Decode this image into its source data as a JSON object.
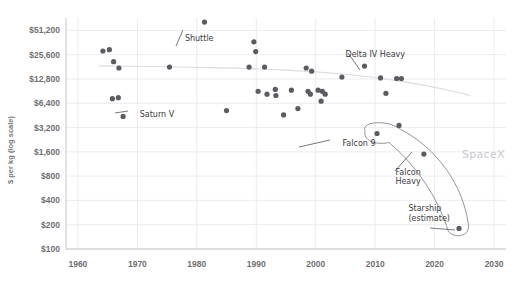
{
  "chart_data": {
    "type": "scatter",
    "title": "",
    "xlabel": "",
    "ylabel": "$ per kg (log scale)",
    "xlim": [
      1958,
      2032
    ],
    "ylim": [
      100,
      73000
    ],
    "yscale": "log",
    "grid": true,
    "legend": null,
    "x_ticks": [
      1960,
      1970,
      1980,
      1990,
      2000,
      2010,
      2020,
      2030
    ],
    "x_tick_labels": [
      "1960",
      "1970",
      "1980",
      "1990",
      "2000",
      "2010",
      "2020",
      "2030"
    ],
    "y_ticks": [
      100,
      200,
      400,
      800,
      1600,
      3200,
      6400,
      12800,
      25600,
      51200
    ],
    "y_tick_labels": [
      "$100",
      "$200",
      "$400",
      "$800",
      "$1,600",
      "$3,200",
      "$6,400",
      "$12,800",
      "$25,600",
      "$51,200"
    ],
    "series": [
      {
        "name": "Launch vehicles",
        "color": "#5b5b62",
        "points": [
          {
            "x": 1964.2,
            "y": 28500
          },
          {
            "x": 1965.3,
            "y": 29500
          },
          {
            "x": 1966.0,
            "y": 21000
          },
          {
            "x": 1966.9,
            "y": 17500
          },
          {
            "x": 1965.8,
            "y": 7300
          },
          {
            "x": 1966.8,
            "y": 7500
          },
          {
            "x": 1967.6,
            "y": 4400,
            "label": "Saturn V"
          },
          {
            "x": 1975.4,
            "y": 18000
          },
          {
            "x": 1981.3,
            "y": 65000,
            "label": "Shuttle"
          },
          {
            "x": 1985.0,
            "y": 5200
          },
          {
            "x": 1989.6,
            "y": 37000
          },
          {
            "x": 1989.9,
            "y": 28000
          },
          {
            "x": 1988.8,
            "y": 18000
          },
          {
            "x": 1991.4,
            "y": 18000
          },
          {
            "x": 1990.3,
            "y": 9000
          },
          {
            "x": 1991.8,
            "y": 8300
          },
          {
            "x": 1993.2,
            "y": 9500
          },
          {
            "x": 1993.3,
            "y": 8000
          },
          {
            "x": 1994.6,
            "y": 4600
          },
          {
            "x": 1995.9,
            "y": 9300
          },
          {
            "x": 1997.0,
            "y": 5500
          },
          {
            "x": 1998.4,
            "y": 17500
          },
          {
            "x": 1999.3,
            "y": 16000
          },
          {
            "x": 1998.7,
            "y": 9000
          },
          {
            "x": 1999.1,
            "y": 8300
          },
          {
            "x": 2000.4,
            "y": 9300
          },
          {
            "x": 2001.1,
            "y": 9000
          },
          {
            "x": 2001.6,
            "y": 8300
          },
          {
            "x": 2000.9,
            "y": 6800
          },
          {
            "x": 2004.4,
            "y": 13500,
            "label": "Delta IV Heavy"
          },
          {
            "x": 2008.2,
            "y": 18500
          },
          {
            "x": 2010.9,
            "y": 13200
          },
          {
            "x": 2013.6,
            "y": 13000
          },
          {
            "x": 2014.4,
            "y": 13000
          },
          {
            "x": 2011.8,
            "y": 8500
          },
          {
            "x": 2014.0,
            "y": 3400
          },
          {
            "x": 2010.3,
            "y": 2700,
            "label": "Falcon 9"
          },
          {
            "x": 2018.2,
            "y": 1500,
            "label": "Falcon Heavy"
          },
          {
            "x": 2024.1,
            "y": 180,
            "label": "Starship (estimate)"
          }
        ]
      }
    ],
    "trend_line": {
      "name": "cost trend",
      "color": "#dcdce1",
      "points": [
        {
          "x": 1963.5,
          "y": 18600
        },
        {
          "x": 1975.0,
          "y": 18300
        },
        {
          "x": 1990.0,
          "y": 17200
        },
        {
          "x": 2000.0,
          "y": 15800
        },
        {
          "x": 2010.0,
          "y": 13600
        },
        {
          "x": 2020.0,
          "y": 10200
        },
        {
          "x": 2026.0,
          "y": 8000
        }
      ]
    },
    "annotations": [
      {
        "text": "Shuttle",
        "x": 1978.0,
        "y": 38000,
        "style": "handwritten"
      },
      {
        "text": "Saturn V",
        "x": 1970.4,
        "y": 4300,
        "style": "handwritten"
      },
      {
        "text": "Delta IV Heavy",
        "x": 2005.0,
        "y": 24000,
        "style": "handwritten"
      },
      {
        "text": "Falcon 9",
        "x": 2004.5,
        "y": 1900,
        "style": "handwritten"
      },
      {
        "text": "Falcon",
        "x": 2013.4,
        "y": 830,
        "style": "handwritten"
      },
      {
        "text": "Heavy",
        "x": 2013.4,
        "y": 640,
        "style": "handwritten"
      },
      {
        "text": "Starship",
        "x": 2015.6,
        "y": 300,
        "style": "handwritten"
      },
      {
        "text": "(estimate)",
        "x": 2015.6,
        "y": 225,
        "style": "handwritten"
      },
      {
        "text": "SpaceX",
        "x": 2024.6,
        "y": 1350,
        "style": "brand-watermark"
      }
    ],
    "highlight_region": {
      "label": "SpaceX",
      "shape": "hand-drawn-loop",
      "encircles": [
        "Falcon 9",
        "Falcon Heavy",
        "Starship (estimate)"
      ]
    }
  }
}
